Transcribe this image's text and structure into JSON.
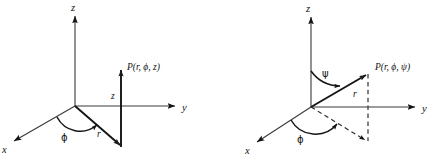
{
  "figure": {
    "title": "",
    "background": "#ffffff",
    "ink_color": "#141414",
    "width": 440,
    "height": 159,
    "panels": [
      {
        "id": "cylindrical",
        "name": "cylindrical-coordinates-diagram",
        "origin": [
          75,
          106
        ],
        "axes": [
          {
            "name": "z-axis",
            "label": "z",
            "label_pos": [
              71,
              10
            ],
            "from": [
              75,
              106
            ],
            "to": [
              75,
              14
            ]
          },
          {
            "name": "y-axis",
            "label": "y",
            "label_pos": [
              184,
              110
            ],
            "from": [
              75,
              106
            ],
            "to": [
              177,
              106
            ]
          },
          {
            "name": "x-axis",
            "label": "x",
            "label_pos": [
              3,
              152
            ],
            "from": [
              75,
              106
            ],
            "to": [
              12,
              142
            ]
          }
        ],
        "point_label": "P(r, ϕ, z)",
        "point_label_pos": [
          126,
          66
        ],
        "point_pos": [
          121,
          68
        ],
        "vectors": [
          {
            "name": "radial-distance-r",
            "label": "r",
            "label_pos": [
              99,
              135
            ],
            "from": [
              75,
              106
            ],
            "to": [
              122,
              147
            ]
          },
          {
            "name": "height-z",
            "label": "z",
            "label_pos": [
              112,
              96
            ],
            "from": [
              121,
              147
            ],
            "to": [
              121,
              68
            ]
          }
        ],
        "angles": [
          {
            "name": "azimuth-phi",
            "label": "ϕ",
            "label_pos": [
              63,
              138
            ]
          }
        ]
      },
      {
        "id": "spherical",
        "name": "spherical-coordinates-diagram",
        "origin": [
          311,
          107
        ],
        "axes": [
          {
            "name": "z-axis",
            "label": "z",
            "label_pos": [
              307,
              11
            ],
            "from": [
              311,
              107
            ],
            "to": [
              311,
              15
            ]
          },
          {
            "name": "y-axis",
            "label": "y",
            "label_pos": [
              424,
              111
            ],
            "from": [
              311,
              107
            ],
            "to": [
              417,
              107
            ]
          },
          {
            "name": "x-axis",
            "label": "x",
            "label_pos": [
              246,
              153
            ],
            "from": [
              311,
              107
            ],
            "to": [
              255,
              143
            ]
          }
        ],
        "point_label": "P(r, ϕ, ψ)",
        "point_label_pos": [
          374,
          66
        ],
        "point_pos": [
          368,
          72
        ],
        "vectors": [
          {
            "name": "radius-vector-r",
            "label": "r",
            "label_pos": [
              355,
              95
            ],
            "from": [
              311,
              107
            ],
            "to": [
              368,
              73
            ]
          }
        ],
        "dashed": [
          {
            "name": "vertical-drop-from-point",
            "from": [
              368,
              74
            ],
            "to": [
              368,
              141
            ]
          },
          {
            "name": "ground-projection-line",
            "from": [
              311,
              107
            ],
            "to": [
              367,
              142
            ]
          }
        ],
        "angles": [
          {
            "name": "polar-angle-psi",
            "label": "ψ",
            "label_pos": [
              326,
              74
            ]
          },
          {
            "name": "azimuth-phi",
            "label": "ϕ",
            "label_pos": [
              300,
              140
            ]
          }
        ]
      }
    ]
  }
}
